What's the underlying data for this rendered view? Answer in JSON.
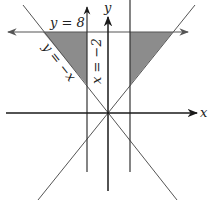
{
  "diagram": {
    "labels": {
      "x_axis": "x",
      "y_axis": "y",
      "line_y8": "y = 8",
      "line_y_neg_x": "y = −x",
      "line_x_neg2": "x = −2"
    },
    "colors": {
      "shade": "#8c8c8c",
      "axis": "#1a1a1a",
      "line": "#555555",
      "background": "#ffffff"
    },
    "lines": [
      {
        "name": "x-axis",
        "equation": "y = 0"
      },
      {
        "name": "y-axis",
        "equation": "x = 0"
      },
      {
        "name": "horizontal-line",
        "equation": "y = 8"
      },
      {
        "name": "vertical-line-left",
        "equation": "x = -2"
      },
      {
        "name": "vertical-line-right",
        "equation": "x = 2"
      },
      {
        "name": "diagonal-line-neg",
        "equation": "y = -x"
      },
      {
        "name": "diagonal-line-pos",
        "equation": "y = x"
      }
    ],
    "shaded_regions": [
      {
        "name": "left-triangle",
        "bounded_by": [
          "y = 8",
          "x = -2",
          "y = -x"
        ]
      },
      {
        "name": "right-triangle",
        "bounded_by": [
          "y = 8",
          "x = 2",
          "y = x"
        ]
      }
    ]
  }
}
